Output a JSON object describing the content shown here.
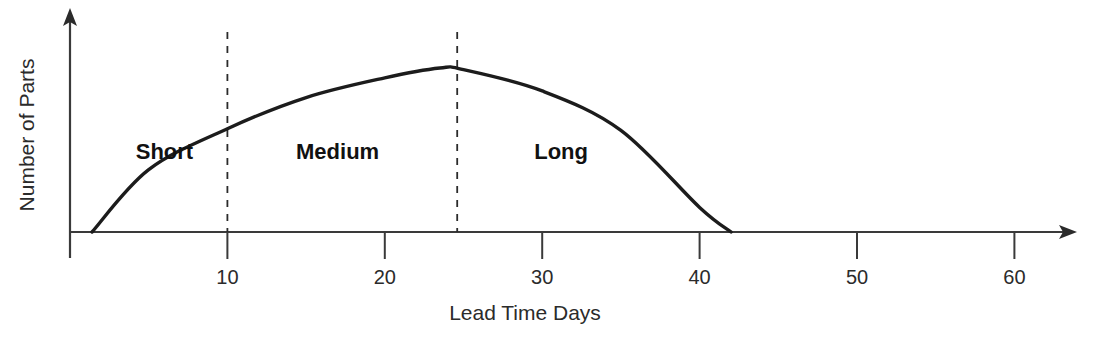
{
  "chart_data": {
    "type": "line",
    "title": "",
    "subtitle": "",
    "xlabel": "Lead Time Days",
    "ylabel": "Number of Parts",
    "xlim": [
      0,
      64
    ],
    "ylim": [
      0,
      1
    ],
    "grid": false,
    "legend_position": "none",
    "x_ticks": [
      {
        "value": 10,
        "label": "10"
      },
      {
        "value": 20,
        "label": "20"
      },
      {
        "value": 30,
        "label": "30"
      },
      {
        "value": 40,
        "label": "40"
      },
      {
        "value": 50,
        "label": "50"
      },
      {
        "value": 60,
        "label": "60"
      }
    ],
    "y_ticks": [],
    "series": [
      {
        "name": "Lead time distribution",
        "color": "#1c1c1c",
        "x": [
          1.4,
          5,
          10,
          15,
          20,
          23.5,
          25,
          30,
          35,
          40,
          42
        ],
        "y": [
          0.0,
          0.38,
          0.63,
          0.82,
          0.94,
          1.0,
          0.99,
          0.86,
          0.62,
          0.15,
          0.0
        ]
      }
    ],
    "annotations": [
      {
        "name": "short",
        "label": "Short",
        "x_center": 6.0,
        "y_position": 0.5
      },
      {
        "name": "medium",
        "label": "Medium",
        "x_center": 17.0,
        "y_position": 0.5
      },
      {
        "name": "long",
        "label": "Long",
        "x_center": 31.2,
        "y_position": 0.5
      }
    ],
    "dividers": [
      {
        "name": "short-medium-divider",
        "x": 10,
        "style": "dashed"
      },
      {
        "name": "medium-long-divider",
        "x": 24.6,
        "style": "dashed"
      }
    ],
    "curve_start_x": 1.4,
    "curve_end_x": 42,
    "curve_peak_x": 23.5
  },
  "colors": {
    "curve": "#1c1c1c",
    "axis": "#3a3a3a",
    "divider": "#2b2b2b",
    "text": "#2b2b2b",
    "label_text": "#111111",
    "background": "#ffffff"
  }
}
